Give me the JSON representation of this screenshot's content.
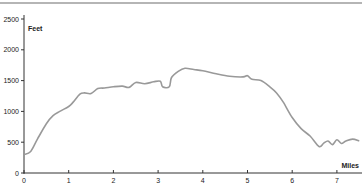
{
  "chart_data": {
    "type": "line",
    "title": "",
    "xlabel": "Miles",
    "ylabel": "Feet",
    "xlim": [
      0,
      7.5
    ],
    "ylim": [
      0,
      2500
    ],
    "grid": false,
    "legend": null,
    "x_ticks": [
      "0",
      "1",
      "2",
      "3",
      "4",
      "5",
      "6",
      "7"
    ],
    "y_ticks": [
      "0",
      "500",
      "1000",
      "1500",
      "2000",
      "2500"
    ],
    "series": [
      {
        "name": "Elevation",
        "color": "#999999",
        "x": [
          0,
          0.15,
          0.3,
          0.5,
          0.65,
          0.8,
          1.0,
          1.1,
          1.25,
          1.35,
          1.5,
          1.65,
          1.8,
          2.0,
          2.2,
          2.35,
          2.5,
          2.7,
          2.9,
          3.05,
          3.1,
          3.25,
          3.3,
          3.45,
          3.6,
          3.8,
          4.0,
          4.3,
          4.6,
          4.9,
          5.0,
          5.1,
          5.3,
          5.5,
          5.65,
          5.8,
          6.0,
          6.2,
          6.4,
          6.6,
          6.7,
          6.8,
          6.9,
          7.0,
          7.1,
          7.2,
          7.35,
          7.5
        ],
        "y": [
          300,
          350,
          550,
          800,
          930,
          1000,
          1080,
          1150,
          1280,
          1300,
          1290,
          1370,
          1380,
          1400,
          1410,
          1390,
          1470,
          1450,
          1480,
          1490,
          1400,
          1400,
          1550,
          1650,
          1700,
          1680,
          1660,
          1610,
          1570,
          1560,
          1580,
          1520,
          1500,
          1400,
          1300,
          1150,
          900,
          720,
          600,
          430,
          480,
          520,
          460,
          540,
          480,
          520,
          550,
          520
        ]
      }
    ]
  }
}
